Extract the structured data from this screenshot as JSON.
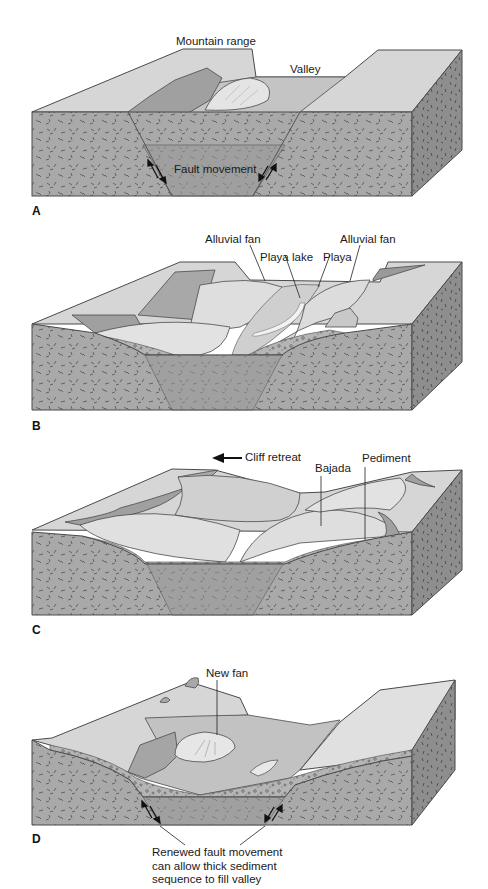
{
  "figure": {
    "panels": [
      {
        "id": "A",
        "letter": "A",
        "labels": {
          "mountain_range": "Mountain range",
          "valley": "Valley",
          "fault_movement": "Fault movement"
        }
      },
      {
        "id": "B",
        "letter": "B",
        "labels": {
          "alluvial_fan_left": "Alluvial fan",
          "playa_lake": "Playa lake",
          "playa": "Playa",
          "alluvial_fan_right": "Alluvial fan"
        }
      },
      {
        "id": "C",
        "letter": "C",
        "labels": {
          "cliff_retreat": "Cliff retreat",
          "bajada": "Bajada",
          "pediment": "Pediment"
        }
      },
      {
        "id": "D",
        "letter": "D",
        "labels": {
          "new_fan": "New fan"
        },
        "note": [
          "Renewed fault movement",
          "can allow thick sediment",
          "sequence to fill valley"
        ]
      }
    ],
    "colors": {
      "rock_front": "#a9a9a9",
      "rock_side": "#8e8e8e",
      "graben": "#9a9a9a",
      "top_surface": "#d6d6d6",
      "valley_floor": "#c4c4c4",
      "fan": "#e2e2e2",
      "scarp": "#9f9f9f",
      "sediment": "#b8b8b8",
      "outline": "#4a4a4a"
    }
  }
}
